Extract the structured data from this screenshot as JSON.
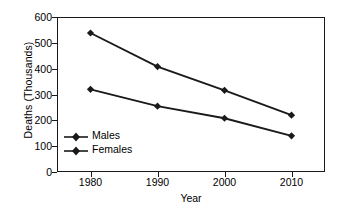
{
  "chart_data": {
    "type": "line",
    "title": "",
    "xlabel": "Year",
    "ylabel": "Deaths (Thousands)",
    "x": [
      1980,
      1990,
      2000,
      2010
    ],
    "categories": [
      "1980",
      "1990",
      "2000",
      "2010"
    ],
    "series": [
      {
        "name": "Males",
        "values": [
          538,
          408,
          316,
          220
        ],
        "marker": "diamond",
        "color": "#1a1a1a"
      },
      {
        "name": "Females",
        "values": [
          320,
          255,
          208,
          140
        ],
        "marker": "diamond",
        "color": "#1a1a1a"
      }
    ],
    "ylim": [
      0,
      600
    ],
    "yticks": [
      0,
      100,
      200,
      300,
      400,
      500,
      600
    ],
    "ytick_labels": [
      "0",
      "100",
      "200",
      "300",
      "400",
      "500",
      "600"
    ],
    "xlim": [
      1975,
      2015
    ],
    "xticks": [
      1980,
      1990,
      2000,
      2010
    ],
    "xtick_labels": [
      "1980",
      "1990",
      "2000",
      "2010"
    ],
    "grid": false,
    "legend_position": "inside-lower-left",
    "legend_entries": [
      "Males",
      "Females"
    ],
    "line_color": "#1a1a1a",
    "background_color": "#ffffff",
    "frame": true
  },
  "axes": {
    "y_title": "Deaths (Thousands)",
    "x_title": "Year"
  },
  "legend": {
    "items": [
      {
        "label": "Males"
      },
      {
        "label": "Females"
      }
    ]
  }
}
